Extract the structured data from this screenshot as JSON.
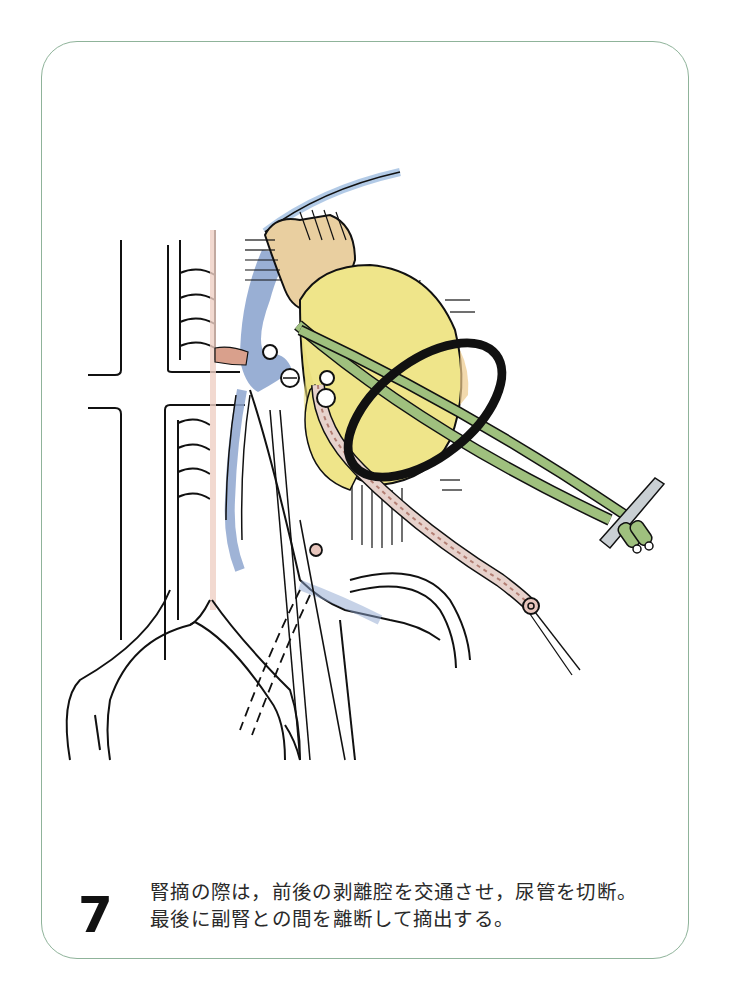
{
  "figure": {
    "number": "7",
    "caption": {
      "line1": "腎摘の際は，前後の剥離腔を交通させ，尿管を切断。",
      "line2": "最後に副腎との間を離断して摘出する。"
    }
  },
  "illustration": {
    "subject": "nephrectomy-kidney-removal",
    "elements": [
      "kidney",
      "adrenal-gland",
      "ureter",
      "renal-vein",
      "aorta",
      "vena-cava",
      "vessel-loop",
      "forceps",
      "clips"
    ]
  },
  "colors": {
    "frame_border": "#8fb39a",
    "kidney_yellow": "#efe58a",
    "adrenal_tan": "#e9cfa0",
    "vein_blue": "#8ea6cf",
    "artery_pink": "#d9a08c",
    "tube_green": "#9fc07e",
    "ink": "#111111"
  }
}
